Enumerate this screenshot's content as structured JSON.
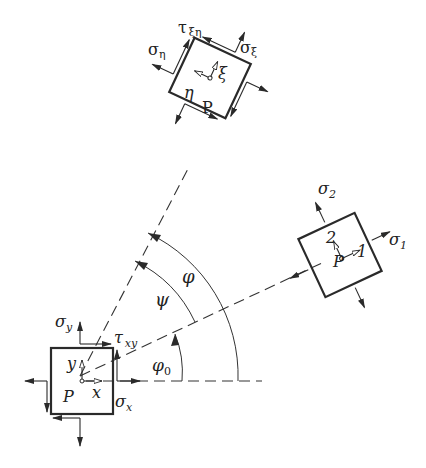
{
  "diagram": {
    "title": "",
    "elements": {
      "base": {
        "point": "P",
        "axes": [
          "x",
          "y"
        ],
        "stresses": {
          "sigma_x": "σ",
          "sigma_x_sub": "x",
          "sigma_y": "σ",
          "sigma_y_sub": "y",
          "tau": "τ",
          "tau_sub": "xy"
        }
      },
      "principal": {
        "point": "P",
        "axes": [
          "1",
          "2"
        ],
        "stresses": {
          "sigma_1": "σ",
          "sigma_1_sub": "1",
          "sigma_2": "σ",
          "sigma_2_sub": "2"
        }
      },
      "rotated": {
        "point": "P",
        "axes": [
          "ξ",
          "η"
        ],
        "stresses": {
          "sigma_xi": "σ",
          "sigma_xi_sub": "ξ",
          "sigma_eta": "σ",
          "sigma_eta_sub": "η",
          "tau": "τ",
          "tau_sub": "ξη"
        }
      }
    },
    "angles": {
      "phi0": "φ",
      "phi0_sub": "0",
      "psi": "ψ",
      "phi": "φ"
    }
  }
}
